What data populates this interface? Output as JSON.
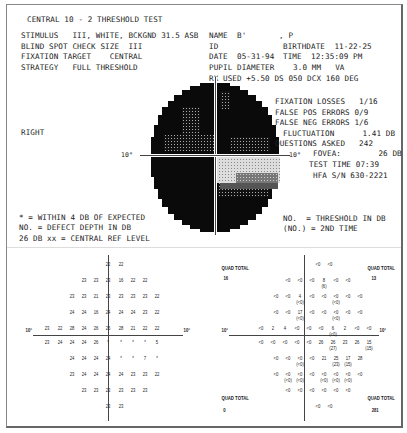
{
  "header": {
    "title": "CENTRAL 10 - 2 THRESHOLD TEST",
    "stimulus": "STIMULUS   III, WHITE, BCKGND 31.5 ASB",
    "blind_spot": "BLIND SPOT CHECK SIZE  III",
    "fixation_target": "FIXATION TARGET    CENTRAL",
    "strategy": "STRATEGY   FULL THRESHOLD",
    "name": "NAME  B'       , P",
    "id": "ID",
    "birthdate": "BIRTHDATE  11-22-25",
    "date": "DATE  05-31-94",
    "time": "TIME  12:35:09 PM",
    "pupil": "PUPIL DIAMETER    3.0 MM   VA",
    "rx": "RX USED +5.50 DS 050 DCX 160 DEG"
  },
  "eye": "RIGHT",
  "reliability": {
    "fixation_losses": "FIXATION LOSSES   1/16",
    "false_pos": "FALSE POS ERRORS 0/9",
    "false_neg": "FALSE NEG ERRORS 1/6",
    "fluctuation": "FLUCTUATION      1.41 DB",
    "questions": "QUESTIONS ASKED   242",
    "fovea": "FOVEA:        26 DB",
    "test_time": "TEST TIME 07:39",
    "serial": "HFA S/N 630-2221"
  },
  "greyscale": {
    "axis_label_left": "10°",
    "axis_label_right": "10°"
  },
  "legend_left": {
    "line1": "* = WITHIN 4 DB OF EXPECTED",
    "line2": "NO. = DEFECT DEPTH IN DB",
    "line3": "26 DB xx = CENTRAL REF LEVEL"
  },
  "legend_right": {
    "line1": "NO.  = THRESHOLD IN DB",
    "line2": "(NO.) = 2ND TIME"
  },
  "left_grid": {
    "axis_left": "10°",
    "axis_right": "10°",
    "rows": [
      [
        [
          "22",
          91
        ],
        [
          "22",
          104
        ]
      ],
      [
        [
          "23",
          67
        ],
        [
          "23",
          79
        ],
        [
          "23",
          91
        ],
        [
          "16",
          104
        ],
        [
          "22",
          116
        ],
        [
          "22",
          128
        ]
      ],
      [
        [
          "23",
          55
        ],
        [
          "23",
          67
        ],
        [
          "21",
          79
        ],
        [
          "23",
          91
        ],
        [
          "23",
          104
        ],
        [
          "23",
          116
        ],
        [
          "23",
          128
        ],
        [
          "22",
          140
        ]
      ],
      [
        [
          "24",
          55
        ],
        [
          "24",
          67
        ],
        [
          "16",
          79
        ],
        [
          "24",
          91
        ],
        [
          "24",
          104
        ],
        [
          "24",
          116
        ],
        [
          "23",
          128
        ],
        [
          "22",
          140
        ]
      ],
      [
        [
          "23",
          30
        ],
        [
          "22",
          43
        ],
        [
          "28",
          55
        ],
        [
          "24",
          67
        ],
        [
          "26",
          79
        ],
        [
          "26",
          91
        ],
        [
          "28",
          104
        ],
        [
          "21",
          116
        ],
        [
          "22",
          128
        ],
        [
          "22",
          140
        ]
      ],
      [
        [
          "23",
          30
        ],
        [
          "24",
          43
        ],
        [
          "24",
          55
        ],
        [
          "24",
          67
        ],
        [
          "26",
          79
        ],
        [
          "*",
          91
        ],
        [
          "*",
          104
        ],
        [
          "*",
          116
        ],
        [
          "*",
          128
        ],
        [
          "5",
          140
        ]
      ],
      [
        [
          "24",
          55
        ],
        [
          "24",
          67
        ],
        [
          "24",
          79
        ],
        [
          "24",
          91
        ],
        [
          "*",
          104
        ],
        [
          "*",
          116
        ],
        [
          "7",
          128
        ],
        [
          "*",
          140
        ]
      ],
      [
        [
          "23",
          55
        ],
        [
          "24",
          67
        ],
        [
          "24",
          79
        ],
        [
          "24",
          91
        ],
        [
          "24",
          104
        ],
        [
          "23",
          116
        ],
        [
          "23",
          128
        ],
        [
          "22",
          140
        ]
      ],
      [
        [
          "23",
          67
        ],
        [
          "23",
          79
        ],
        [
          "23",
          91
        ],
        [
          "23",
          104
        ],
        [
          "23",
          116
        ],
        [
          "23",
          128
        ]
      ],
      [
        [
          "23",
          91
        ],
        [
          "23",
          104
        ]
      ]
    ]
  },
  "right_grid": {
    "axis_left": "10°",
    "axis_right": "10°",
    "quad_total_label": "QUAD TOTAL",
    "quad_totals": {
      "top_left": "16",
      "top_right": "13",
      "bottom_left": "0",
      "bottom_right": "281"
    },
    "rows_text": [
      "<0  <0",
      "<0  <0  <0  8(6)  <0  <0",
      "<0  <0  4(<0)  <0  <0  <0(<0)  <0  <0",
      "<0  <0  17(<0)  <0  <0  <0(<0)  <0  <0",
      "<0  2  4  <0  <0  <0  6(<0)  2  <0  <0",
      "<0  <0  <0  <0  <0  26  26(27)  23  26  15(15)",
      "<0  <0  <0(<0)  <0  21  25(23)  17(15)  28",
      "<0  <0(<0)  <0(<0)  <0  <0(<0)  <0(<0)  <0(<0)  <0",
      "<0  <0  <0  <0  <0  <0",
      "<0  <0"
    ]
  }
}
